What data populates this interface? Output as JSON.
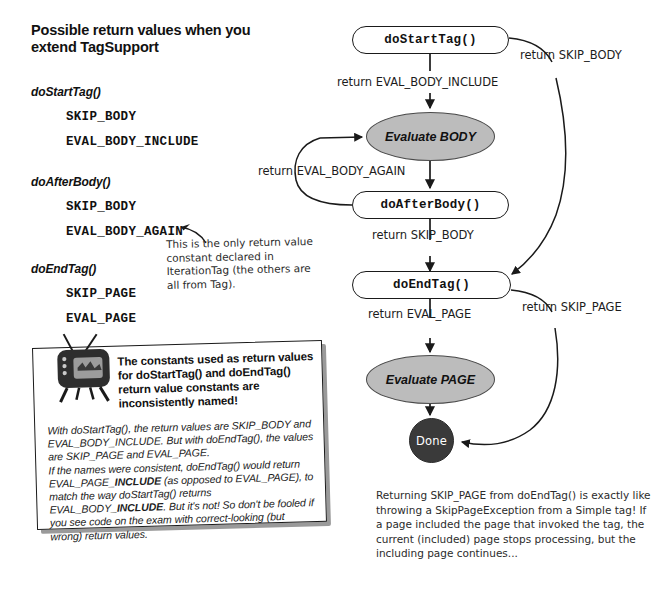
{
  "heading": "Possible return values when you extend TagSupport",
  "methods": [
    {
      "name": "doStartTag()",
      "constants": [
        "SKIP_BODY",
        "EVAL_BODY_INCLUDE"
      ]
    },
    {
      "name": "doAfterBody()",
      "constants": [
        "SKIP_BODY",
        "EVAL_BODY_AGAIN"
      ]
    },
    {
      "name": "doEndTag()",
      "constants": [
        "SKIP_PAGE",
        "EVAL_PAGE"
      ]
    }
  ],
  "annotations": {
    "iteration_tag_note": "This is the only return value constant declared in IterationTag (the others are all from Tag).",
    "skip_page_note": "Returning SKIP_PAGE from doEndTag() is exactly like throwing a SkipPageException from a Simple tag! If a page included the page that invoked the tag, the current (included) page stops processing, but the including page continues..."
  },
  "callout": {
    "icon": "tv-icon",
    "title": "The constants used as return values for doStartTag() and doEndTag() return value constants are inconsistently named!",
    "paragraphs": [
      "With doStartTag(), the return values are SKIP_BODY and EVAL_BODY_INCLUDE. But with doEndTag(), the values are SKIP_PAGE and EVAL_PAGE.",
      "If the names were consistent, doEndTag() would return EVAL_PAGE_INCLUDE (as opposed to EVAL_PAGE), to match the way doStartTag() returns EVAL_BODY_INCLUDE. But it's not! So don't be fooled if you see code on the exam with correct-looking (but wrong) return values."
    ],
    "emphasis_word": "INCLUDE"
  },
  "flowchart": {
    "type": "flow-diagram",
    "nodes": [
      {
        "id": "doStartTag",
        "label": "doStartTag()",
        "shape": "pill"
      },
      {
        "id": "evalBody",
        "label": "Evaluate BODY",
        "shape": "ellipse"
      },
      {
        "id": "doAfterBody",
        "label": "doAfterBody()",
        "shape": "pill"
      },
      {
        "id": "doEndTag",
        "label": "doEndTag()",
        "shape": "pill"
      },
      {
        "id": "evalPage",
        "label": "Evaluate PAGE",
        "shape": "ellipse"
      },
      {
        "id": "done",
        "label": "Done",
        "shape": "circle"
      }
    ],
    "edges": [
      {
        "from": "doStartTag",
        "to": "evalBody",
        "label": "return EVAL_BODY_INCLUDE"
      },
      {
        "from": "doStartTag",
        "to": "doEndTag",
        "label": "return SKIP_BODY"
      },
      {
        "from": "evalBody",
        "to": "doAfterBody",
        "label": ""
      },
      {
        "from": "doAfterBody",
        "to": "evalBody",
        "label": "return EVAL_BODY_AGAIN"
      },
      {
        "from": "doAfterBody",
        "to": "doEndTag",
        "label": "return SKIP_BODY"
      },
      {
        "from": "doEndTag",
        "to": "evalPage",
        "label": "return EVAL_PAGE"
      },
      {
        "from": "doEndTag",
        "to": "done",
        "label": "return SKIP_PAGE"
      },
      {
        "from": "evalPage",
        "to": "done",
        "label": ""
      }
    ]
  },
  "colors": {
    "ellipse_fill": "#bcbcbc",
    "done_fill": "#3a3a3a",
    "stroke": "#1a1a1a",
    "paper": "#ffffff"
  }
}
